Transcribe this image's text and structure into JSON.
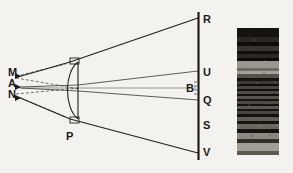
{
  "figure": {
    "background_color": "#f4f2ee",
    "ink_color": "#1b1b1b",
    "width": 293,
    "height": 173
  },
  "source_labels": [
    {
      "id": "M",
      "text": "M",
      "x": 8,
      "y": 76
    },
    {
      "id": "A",
      "text": "A",
      "x": 8,
      "y": 87
    },
    {
      "id": "N",
      "text": "N",
      "x": 8,
      "y": 98
    }
  ],
  "lens": {
    "label": "P",
    "label_x": 66,
    "label_y": 140,
    "flat_side_x": 78,
    "top_y": 61,
    "bottom_y": 120,
    "bulge_x": 62
  },
  "screen": {
    "name": "screen-line",
    "x": 198.5,
    "top_y": 12,
    "bottom_y": 160,
    "labels": [
      {
        "id": "R",
        "text": "R",
        "x": 203,
        "y": 23,
        "side": "right"
      },
      {
        "id": "U",
        "text": "U",
        "x": 203,
        "y": 76,
        "side": "right"
      },
      {
        "id": "B",
        "text": "B",
        "x": 186,
        "y": 92,
        "side": "left"
      },
      {
        "id": "Q",
        "text": "Q",
        "x": 203,
        "y": 104,
        "side": "right"
      },
      {
        "id": "S",
        "text": "S",
        "x": 203,
        "y": 129,
        "side": "right"
      },
      {
        "id": "V",
        "text": "V",
        "x": 203,
        "y": 156,
        "side": "right"
      }
    ]
  },
  "rays": {
    "upper_marginal": "M-edge to R",
    "lower_marginal": "N-edge to V",
    "upper_inner": "A to U",
    "lower_inner": "A to Q",
    "dashed_construction": "virtual back-projection to M and N"
  },
  "spectrum_photo": {
    "name": "spectrum-photograph",
    "x": 237,
    "y": 28,
    "width": 42,
    "height": 127,
    "frame_color": "#0d0d0d",
    "bands": [
      {
        "top": 0,
        "height": 9,
        "color": "#151311"
      },
      {
        "top": 9,
        "height": 5,
        "color": "#2a2623"
      },
      {
        "top": 14,
        "height": 4,
        "color": "#0e0d0c"
      },
      {
        "top": 18,
        "height": 5,
        "color": "#3a3530"
      },
      {
        "top": 23,
        "height": 3,
        "color": "#100f0e"
      },
      {
        "top": 26,
        "height": 4,
        "color": "#2b2724"
      },
      {
        "top": 30,
        "height": 3,
        "color": "#0c0b0a"
      },
      {
        "top": 33,
        "height": 7,
        "color": "#9a958d"
      },
      {
        "top": 40,
        "height": 3,
        "color": "#6e6a63"
      },
      {
        "top": 43,
        "height": 3,
        "color": "#a8a39b"
      },
      {
        "top": 46,
        "height": 4,
        "color": "#55514b"
      },
      {
        "top": 50,
        "height": 3,
        "color": "#13120f"
      },
      {
        "top": 53,
        "height": 3,
        "color": "#3c3832"
      },
      {
        "top": 56,
        "height": 2,
        "color": "#0f0e0c"
      },
      {
        "top": 58,
        "height": 3,
        "color": "#4a453f"
      },
      {
        "top": 61,
        "height": 2,
        "color": "#100f0d"
      },
      {
        "top": 63,
        "height": 3,
        "color": "#514c45"
      },
      {
        "top": 66,
        "height": 2,
        "color": "#121110"
      },
      {
        "top": 68,
        "height": 3,
        "color": "#57524b"
      },
      {
        "top": 71,
        "height": 2,
        "color": "#141312"
      },
      {
        "top": 73,
        "height": 3,
        "color": "#4e4942"
      },
      {
        "top": 76,
        "height": 2,
        "color": "#131211"
      },
      {
        "top": 78,
        "height": 3,
        "color": "#5c574f"
      },
      {
        "top": 81,
        "height": 2,
        "color": "#151413"
      },
      {
        "top": 83,
        "height": 3,
        "color": "#4a453f"
      },
      {
        "top": 86,
        "height": 3,
        "color": "#131211"
      },
      {
        "top": 89,
        "height": 4,
        "color": "#625d55"
      },
      {
        "top": 93,
        "height": 3,
        "color": "#161514"
      },
      {
        "top": 96,
        "height": 5,
        "color": "#6b665e"
      },
      {
        "top": 101,
        "height": 4,
        "color": "#141312"
      },
      {
        "top": 105,
        "height": 6,
        "color": "#8d887f"
      },
      {
        "top": 111,
        "height": 4,
        "color": "#33302c"
      },
      {
        "top": 115,
        "height": 8,
        "color": "#a39e95"
      },
      {
        "top": 123,
        "height": 4,
        "color": "#5e5a53"
      },
      {
        "top": 127,
        "height": 18,
        "color": "#0a0a09"
      }
    ]
  }
}
